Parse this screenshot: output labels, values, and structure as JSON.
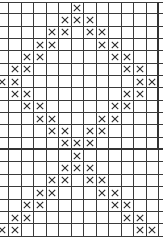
{
  "pattern": {
    "type": "knitting-chart",
    "symbol": "cross",
    "columns": 14,
    "sections": [
      {
        "name": "upper",
        "rows": [
          [
            6
          ],
          [
            5,
            6,
            7
          ],
          [
            4,
            5,
            7,
            8
          ],
          [
            3,
            4,
            8,
            9
          ],
          [
            2,
            3,
            9,
            10
          ],
          [
            1,
            2,
            10,
            11
          ],
          [
            0,
            1,
            11,
            12
          ],
          [
            1,
            2,
            10,
            11
          ],
          [
            2,
            3,
            9,
            10
          ],
          [
            3,
            4,
            8,
            9
          ],
          [
            4,
            5,
            7,
            8
          ],
          [
            5,
            6,
            7
          ]
        ]
      },
      {
        "name": "lower",
        "rows": [
          [
            6
          ],
          [
            5,
            6,
            7
          ],
          [
            4,
            5,
            7,
            8
          ],
          [
            3,
            4,
            8,
            9
          ],
          [
            2,
            3,
            9,
            10
          ],
          [
            1,
            2,
            10,
            11
          ],
          [
            0,
            1,
            11,
            12
          ]
        ]
      }
    ],
    "colors": {
      "grid": "#3a3a3a",
      "mark": "#2a2a2a",
      "background": "#ffffff"
    }
  }
}
